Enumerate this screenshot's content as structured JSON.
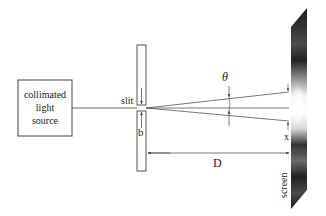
{
  "diagram": {
    "source": {
      "label_lines": [
        "collimated",
        "light",
        "source"
      ]
    },
    "slit": {
      "label": "slit",
      "width_label": "b"
    },
    "angle": {
      "label": "θ"
    },
    "distance": {
      "label": "D"
    },
    "screen": {
      "label": "screen",
      "offset_label": "x"
    },
    "colors": {
      "line": "#444444",
      "screen_dark": "#1a1a1a",
      "screen_light": "#ffffff"
    }
  }
}
